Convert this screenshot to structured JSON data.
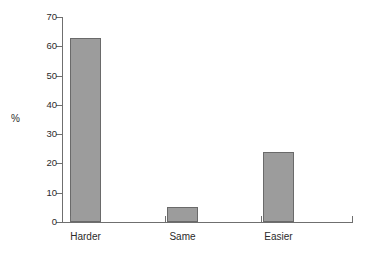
{
  "chart_data": {
    "type": "bar",
    "title": "",
    "subtitle": "",
    "xlabel": "",
    "ylabel": "%",
    "categories": [
      "Harder",
      "Same",
      "Easier"
    ],
    "values": [
      63,
      5,
      24
    ],
    "series": [
      {
        "name": "%",
        "values": [
          63,
          5,
          24
        ]
      }
    ],
    "ylim": [
      0,
      70
    ],
    "yticks": [
      0,
      10,
      20,
      30,
      40,
      50,
      60,
      70
    ],
    "ytick_labels": [
      "0",
      "10",
      "20",
      "30",
      "40",
      "50",
      "60",
      "70"
    ],
    "grid": false,
    "legend": false,
    "legend_position": "none",
    "bar_color": "#9c9c9c",
    "bar_border_color": "#6a6a6a",
    "axis_color": "#6f6f6f",
    "text_color": "#2b2b2b",
    "background_color": "#ffffff"
  }
}
